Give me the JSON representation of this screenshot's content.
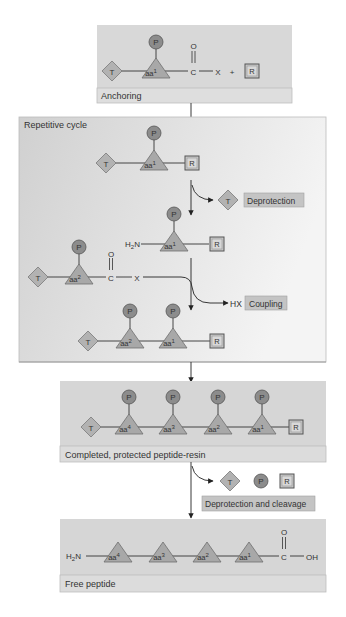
{
  "colors": {
    "panel": "#d6d6d6",
    "panel_light": "#f0f0f0",
    "label_bar": "#dcdcdc",
    "line": "#333333",
    "triangle": "#a8a8a8",
    "diamond": "#b2b2b2",
    "circle": "#8c8c8c",
    "resin_fill": "#c8c8c8",
    "tag_fill": "#c4c4c4"
  },
  "symbols": {
    "protect_t": "T",
    "protect_p": "P",
    "resin": "R",
    "aa1": "aa",
    "aa1_sup": "1",
    "aa2": "aa",
    "aa2_sup": "2",
    "aa3": "aa",
    "aa3_sup": "3",
    "aa4": "aa",
    "aa4_sup": "4"
  },
  "anchoring": {
    "label": "Anchoring",
    "carbonyl_o": "O",
    "carbon": "C",
    "leaving_group": "X",
    "plus": "+"
  },
  "cycle": {
    "label": "Repetitive cycle",
    "deprotection_label": "Deprotection",
    "amine": "H",
    "amine_sub": "2",
    "amine_n": "N",
    "activated_o": "O",
    "activated_c": "C",
    "activated_x": "X",
    "byproduct": "HX",
    "coupling_label": "Coupling"
  },
  "completed": {
    "label": "Completed, protected peptide-resin"
  },
  "cleavage": {
    "label": "Deprotection and cleavage"
  },
  "free_peptide": {
    "label": "Free peptide",
    "amine": "H",
    "amine_sub": "2",
    "amine_n": "N",
    "carbonyl_o": "O",
    "carbon": "C",
    "hydroxyl": "OH"
  }
}
